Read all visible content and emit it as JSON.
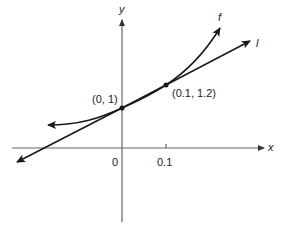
{
  "diagram": {
    "axes": {
      "x_label": "x",
      "y_label": "y",
      "origin_label": "0",
      "tick_label": "0.1"
    },
    "curve": {
      "name": "f"
    },
    "tangent_line": {
      "name": "l"
    },
    "points": [
      {
        "label": "(0, 1)",
        "x": 0,
        "y": 1
      },
      {
        "label": "(0.1, 1.2)",
        "x": 0.1,
        "y": 1.2
      }
    ],
    "colors": {
      "ink": "#1a1a1a",
      "axis": "#555555",
      "background": "#ffffff"
    }
  }
}
